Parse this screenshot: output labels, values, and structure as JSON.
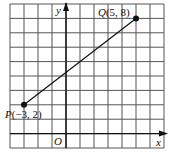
{
  "figure": {
    "type": "coordinate-grid",
    "grid": {
      "cols": 11,
      "rows": 10,
      "x_min": -4,
      "x_max": 7,
      "y_min": -1,
      "y_max": 9,
      "color": "#555555"
    },
    "axes": {
      "x_label": "x",
      "y_label": "y",
      "origin_label": "O",
      "color": "#111111"
    },
    "points": [
      {
        "name": "P",
        "x": -3,
        "y": 2,
        "label": "P(−3, 2)"
      },
      {
        "name": "Q",
        "x": 5,
        "y": 8,
        "label": "Q(5, 8)"
      }
    ],
    "segment": {
      "from": "P",
      "to": "Q",
      "color": "#111111"
    }
  },
  "chart_data": {
    "type": "line",
    "title": "",
    "xlabel": "x",
    "ylabel": "y",
    "xlim": [
      -4,
      7
    ],
    "ylim": [
      -1,
      9
    ],
    "grid": true,
    "series": [
      {
        "name": "PQ",
        "x": [
          -3,
          5
        ],
        "y": [
          2,
          8
        ]
      }
    ],
    "annotations": [
      "P(−3, 2)",
      "Q(5, 8)",
      "O"
    ]
  }
}
